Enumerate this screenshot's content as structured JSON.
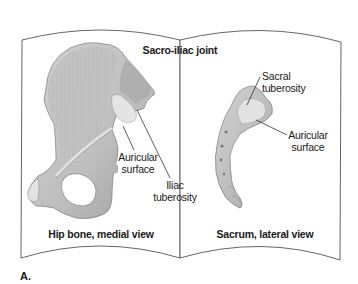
{
  "figure": {
    "panel_letter": "A.",
    "title": "Sacro-iliac joint",
    "left_page": {
      "caption": "Hip bone, medial view",
      "labels": {
        "auricular_line1": "Auricular",
        "auricular_line2": "surface",
        "iliac_line1": "Iliac",
        "iliac_line2": "tuberosity"
      }
    },
    "right_page": {
      "caption": "Sacrum, lateral view",
      "labels": {
        "sacral_tuberosity": "Sacral tuberosity",
        "auricular_line1": "Auricular",
        "auricular_line2": "surface"
      }
    }
  },
  "colors": {
    "page_outline": "#555555",
    "bone_fill": "#c9c9c9",
    "bone_shadow": "#8f8f8f",
    "bone_highlight": "#e6e6e6",
    "text": "#1a1a1a"
  }
}
